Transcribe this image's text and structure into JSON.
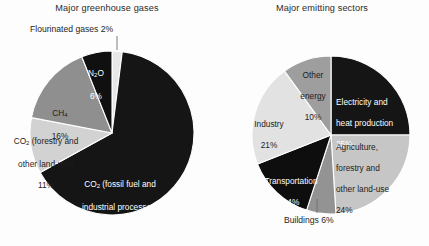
{
  "chart_data": [
    {
      "type": "pie",
      "title": "Major greenhouse gases",
      "unit": "percent",
      "legend": "none",
      "labels_inline": true,
      "categories": [
        "Flourinated gases",
        "CO2 (fossil fuel and industrial processes)",
        "CO2 (forestry and other land-use)",
        "CH4",
        "N2O"
      ],
      "values": [
        2,
        65,
        11,
        16,
        6
      ],
      "slices": [
        {
          "name": "flourinated-gases",
          "label": "Flourinated gases 2%",
          "value": 2,
          "percent_text": "2%",
          "color": "#e8e8e8",
          "label_placement": "callout",
          "text_color": "#1d1d1d"
        },
        {
          "name": "co2-fossil-fuel",
          "label_line1": "CO",
          "label_sub1": "2",
          "label_line1_rest": " (fossil fuel and",
          "label_line2": "industrial processes)",
          "percent_text": "65%",
          "value": 65,
          "color": "#151515",
          "label_placement": "inside",
          "text_color": "#ffffff"
        },
        {
          "name": "co2-forestry-land-use",
          "label_line1": "CO",
          "label_sub1": "2",
          "label_line1_rest": " (forestry and",
          "label_line2": "other land-use)",
          "percent_text": "11%",
          "value": 11,
          "color": "#d2d2d2",
          "label_placement": "outside-left",
          "text_color": "#1d1d1d"
        },
        {
          "name": "ch4",
          "label_line1": "CH",
          "label_sub1": "4",
          "percent_text": "16%",
          "value": 16,
          "color": "#8f8f8f",
          "label_placement": "inside",
          "text_color": "#1d1d1d"
        },
        {
          "name": "n2o",
          "label_line1": "N",
          "label_sub1": "2",
          "label_line1_rest": "O",
          "percent_text": "6%",
          "value": 6,
          "color": "#101010",
          "label_placement": "inside",
          "text_color": "#ffffff"
        }
      ]
    },
    {
      "type": "pie",
      "title": "Major emitting sectors",
      "unit": "percent",
      "legend": "none",
      "labels_inline": true,
      "categories": [
        "Electricity and heat production",
        "Agriculture, forestry and other land-use",
        "Buildings",
        "Transportation",
        "Industry",
        "Other energy"
      ],
      "values": [
        25,
        24,
        6,
        14,
        21,
        10
      ],
      "slices": [
        {
          "name": "electricity-heat-production",
          "label_line1": "Electricity and",
          "label_line2": "heat production",
          "percent_text": "25%",
          "value": 25,
          "color": "#151515",
          "label_placement": "inside",
          "text_color": "#ffffff"
        },
        {
          "name": "agriculture-forestry-land-use",
          "label_line1": "Agriculture,",
          "label_line2": "forestry and",
          "label_line3": "other land-use",
          "percent_text": "24%",
          "value": 24,
          "color": "#c6c6c6",
          "label_placement": "inside",
          "text_color": "#1d1d1d"
        },
        {
          "name": "buildings",
          "label": "Buildings 6%",
          "percent_text": "6%",
          "value": 6,
          "color": "#939393",
          "label_placement": "callout",
          "text_color": "#1d1d1d"
        },
        {
          "name": "transportation",
          "label_line1": "Transportation",
          "percent_text": "14%",
          "value": 14,
          "color": "#0e0e0e",
          "label_placement": "inside",
          "text_color": "#ffffff"
        },
        {
          "name": "industry",
          "label_line1": "Industry",
          "percent_text": "21%",
          "value": 21,
          "color": "#e2e2e2",
          "label_placement": "inside",
          "text_color": "#1d1d1d"
        },
        {
          "name": "other-energy",
          "label_line1": "Other",
          "label_line2": "energy",
          "percent_text": "10%",
          "value": 10,
          "color": "#9e9e9e",
          "label_placement": "inside",
          "text_color": "#1d1d1d"
        }
      ]
    }
  ],
  "left_chart": {
    "title": "Major greenhouse gases",
    "callout_flourinated": "Flourinated gases 2%",
    "label_co2_fossil_l1": "CO",
    "label_co2_fossil_sub": "2",
    "label_co2_fossil_l1b": " (fossil fuel and",
    "label_co2_fossil_l2": "industrial processes)",
    "label_co2_fossil_pct": "65%",
    "label_co2_forestry_l1": "CO",
    "label_co2_forestry_sub": "2",
    "label_co2_forestry_l1b": " (forestry and",
    "label_co2_forestry_l2": "other land-use)",
    "label_co2_forestry_pct": "11%",
    "label_ch4_l1": "CH",
    "label_ch4_sub": "4",
    "label_ch4_pct": "16%",
    "label_n2o_l1": "N",
    "label_n2o_sub": "2",
    "label_n2o_l1b": "O",
    "label_n2o_pct": "6%"
  },
  "right_chart": {
    "title": "Major emitting sectors",
    "label_electricity_l1": "Electricity and",
    "label_electricity_l2": "heat production",
    "label_electricity_pct": "25%",
    "label_agriculture_l1": "Agriculture,",
    "label_agriculture_l2": "forestry and",
    "label_agriculture_l3": "other land-use",
    "label_agriculture_pct": "24%",
    "callout_buildings": "Buildings 6%",
    "label_transportation_l1": "Transportation",
    "label_transportation_pct": "14%",
    "label_industry_l1": "Industry",
    "label_industry_pct": "21%",
    "label_other_energy_l1": "Other",
    "label_other_energy_l2": "energy",
    "label_other_energy_pct": "10%"
  }
}
